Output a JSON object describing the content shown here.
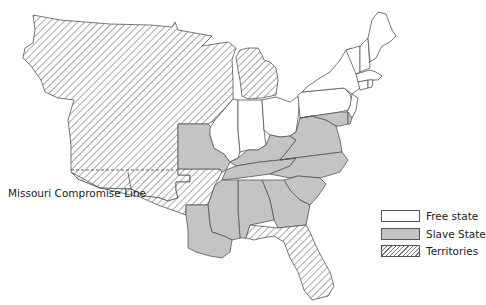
{
  "map": {
    "title": "",
    "annotation": {
      "label": "Missouri Compromise Line"
    },
    "legend": {
      "items": [
        {
          "label": "Free state",
          "fill": "#ffffff",
          "pattern": "solid"
        },
        {
          "label": "Slave State",
          "fill": "#c4c4c4",
          "pattern": "solid"
        },
        {
          "label": "Territories",
          "fill": "#ffffff",
          "pattern": "diagonal-hatch"
        }
      ]
    },
    "colors": {
      "free": "#ffffff",
      "slave": "#c4c4c4",
      "territory_hatch": "#777777",
      "border": "#555555"
    },
    "regions": {
      "free_states": [
        "Maine",
        "New Hampshire",
        "Vermont",
        "Massachusetts",
        "Rhode Island",
        "Connecticut",
        "New York",
        "New Jersey",
        "Pennsylvania",
        "Ohio",
        "Indiana",
        "Illinois"
      ],
      "slave_states": [
        "Delaware",
        "Maryland",
        "Virginia",
        "North Carolina",
        "South Carolina",
        "Georgia",
        "Alabama",
        "Mississippi",
        "Louisiana",
        "Tennessee",
        "Kentucky",
        "Missouri"
      ],
      "territories": [
        "Unorganized Territory",
        "Michigan Territory",
        "Arkansas Territory",
        "Florida Territory"
      ]
    }
  }
}
